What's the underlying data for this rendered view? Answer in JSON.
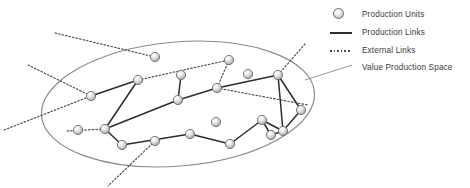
{
  "figure": {
    "background_color": "#ffffff"
  },
  "colors": {
    "node_outline": "#6b6b6b",
    "node_fill_light": "#ffffff",
    "node_fill_mid": "#e6e6e6",
    "node_fill_dark": "#a8a8a8",
    "production_link": "#2d2d2d",
    "external_link": "#4a4a4a",
    "boundary": "#8a8a8a",
    "label_text": "#3a3a3a"
  },
  "legend": {
    "items": [
      {
        "label": "Production Units",
        "marker": "sphere-node-icon"
      },
      {
        "label": "Production Links",
        "marker": "solid-line-icon"
      },
      {
        "label": "External Links",
        "marker": "dotted-line-icon"
      },
      {
        "label": "Value Production Space",
        "marker": "none"
      }
    ]
  },
  "diagram": {
    "boundary": {
      "shape": "ellipse",
      "cx": 178,
      "cy": 104,
      "rx": 137,
      "ry": 62,
      "rotation_deg": -5,
      "stroke": "#8a8a8a",
      "stroke_width": 1.2
    },
    "leader_line": {
      "from_x": 352,
      "from_y": 65,
      "to_x": 305,
      "to_y": 80
    },
    "nodes": [
      {
        "id": "n1",
        "x": 155,
        "y": 57
      },
      {
        "id": "n2",
        "x": 91,
        "y": 96
      },
      {
        "id": "n3",
        "x": 138,
        "y": 80
      },
      {
        "id": "n4",
        "x": 105,
        "y": 129
      },
      {
        "id": "n5",
        "x": 78,
        "y": 130
      },
      {
        "id": "n6",
        "x": 122,
        "y": 145
      },
      {
        "id": "n7",
        "x": 181,
        "y": 75
      },
      {
        "id": "n8",
        "x": 178,
        "y": 100
      },
      {
        "id": "n9",
        "x": 190,
        "y": 134
      },
      {
        "id": "n10",
        "x": 229,
        "y": 60
      },
      {
        "id": "n11",
        "x": 217,
        "y": 88
      },
      {
        "id": "n12",
        "x": 216,
        "y": 122
      },
      {
        "id": "n13",
        "x": 248,
        "y": 74
      },
      {
        "id": "n14",
        "x": 230,
        "y": 144
      },
      {
        "id": "n15",
        "x": 262,
        "y": 120
      },
      {
        "id": "n16",
        "x": 271,
        "y": 135
      },
      {
        "id": "n17",
        "x": 278,
        "y": 75
      },
      {
        "id": "n18",
        "x": 301,
        "y": 110
      },
      {
        "id": "n19",
        "x": 283,
        "y": 131
      },
      {
        "id": "n20",
        "x": 155,
        "y": 141
      }
    ],
    "production_links": [
      {
        "from": "n2",
        "to": "n3"
      },
      {
        "from": "n3",
        "to": "n4"
      },
      {
        "from": "n4",
        "to": "n6"
      },
      {
        "from": "n4",
        "to": "n8"
      },
      {
        "from": "n8",
        "to": "n7"
      },
      {
        "from": "n8",
        "to": "n11"
      },
      {
        "from": "n11",
        "to": "n17"
      },
      {
        "from": "n6",
        "to": "n9"
      },
      {
        "from": "n9",
        "to": "n14"
      },
      {
        "from": "n14",
        "to": "n15"
      },
      {
        "from": "n15",
        "to": "n16"
      },
      {
        "from": "n15",
        "to": "n19"
      },
      {
        "from": "n16",
        "to": "n19"
      },
      {
        "from": "n17",
        "to": "n19"
      },
      {
        "from": "n17",
        "to": "n18"
      },
      {
        "from": "n18",
        "to": "n19"
      }
    ],
    "external_links": [
      {
        "x1": 55,
        "y1": 33,
        "x2": 155,
        "y2": 57
      },
      {
        "x1": 28,
        "y1": 65,
        "x2": 91,
        "y2": 96
      },
      {
        "x1": 4,
        "y1": 130,
        "x2": 91,
        "y2": 96
      },
      {
        "x1": 67,
        "y1": 131,
        "x2": 105,
        "y2": 129
      },
      {
        "x1": 138,
        "y1": 80,
        "x2": 229,
        "y2": 60
      },
      {
        "x1": 229,
        "y1": 60,
        "x2": 217,
        "y2": 88
      },
      {
        "x1": 217,
        "y1": 88,
        "x2": 308,
        "y2": 105
      },
      {
        "x1": 278,
        "y1": 75,
        "x2": 305,
        "y2": 44
      },
      {
        "x1": 155,
        "y1": 141,
        "x2": 108,
        "y2": 186
      }
    ]
  }
}
